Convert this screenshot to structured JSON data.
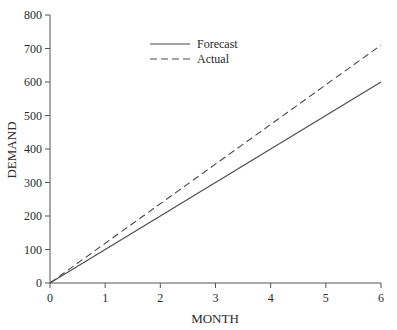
{
  "chart_data": {
    "type": "line",
    "title": "",
    "xlabel": "MONTH",
    "ylabel": "DEMAND",
    "xlim": [
      0,
      6
    ],
    "ylim": [
      0,
      800
    ],
    "x_ticks": [
      0,
      1,
      2,
      3,
      4,
      5,
      6
    ],
    "y_ticks": [
      0,
      100,
      200,
      300,
      400,
      500,
      600,
      700,
      800
    ],
    "grid": false,
    "legend_position": "upper-center",
    "x": [
      0,
      6
    ],
    "series": [
      {
        "name": "Forecast",
        "style": "solid",
        "values": [
          0,
          600
        ]
      },
      {
        "name": "Actual",
        "style": "dashed",
        "values": [
          0,
          710
        ]
      }
    ]
  },
  "colors": {
    "line": "#4a4a4a",
    "axis": "#555555",
    "text": "#2a2a2a"
  }
}
